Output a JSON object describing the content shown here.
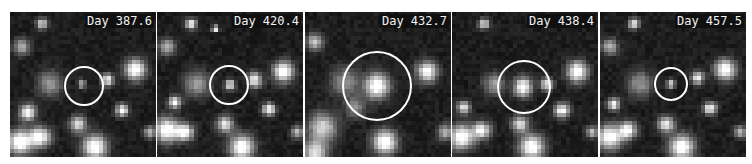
{
  "figure": {
    "panels": [
      {
        "label": "Day 387.6",
        "left": 10,
        "circle": {
          "cx": 74,
          "cy": 74,
          "r": 20
        },
        "sources": [
          {
            "x": 72,
            "y": 72,
            "s": 4,
            "b": 150
          },
          {
            "x": 125,
            "y": 58,
            "s": 10,
            "b": 255
          },
          {
            "x": 98,
            "y": 68,
            "s": 6,
            "b": 210
          },
          {
            "x": 112,
            "y": 98,
            "s": 6,
            "b": 230
          },
          {
            "x": 32,
            "y": 12,
            "s": 5,
            "b": 200
          },
          {
            "x": 12,
            "y": 35,
            "s": 8,
            "b": 150
          },
          {
            "x": 40,
            "y": 72,
            "s": 12,
            "b": 120
          },
          {
            "x": 18,
            "y": 100,
            "s": 8,
            "b": 230
          },
          {
            "x": 10,
            "y": 130,
            "s": 12,
            "b": 255
          },
          {
            "x": 30,
            "y": 125,
            "s": 10,
            "b": 240
          },
          {
            "x": 68,
            "y": 112,
            "s": 8,
            "b": 200
          },
          {
            "x": 85,
            "y": 135,
            "s": 12,
            "b": 255
          },
          {
            "x": 140,
            "y": 120,
            "s": 6,
            "b": 160
          }
        ]
      },
      {
        "label": "Day 420.4",
        "left": 157,
        "circle": {
          "cx": 72,
          "cy": 73,
          "r": 20
        },
        "sources": [
          {
            "x": 73,
            "y": 73,
            "s": 5,
            "b": 210
          },
          {
            "x": 126,
            "y": 60,
            "s": 10,
            "b": 255
          },
          {
            "x": 98,
            "y": 68,
            "s": 7,
            "b": 220
          },
          {
            "x": 112,
            "y": 97,
            "s": 6,
            "b": 230
          },
          {
            "x": 34,
            "y": 12,
            "s": 5,
            "b": 220
          },
          {
            "x": 58,
            "y": 17,
            "s": 3,
            "b": 255
          },
          {
            "x": 10,
            "y": 35,
            "s": 8,
            "b": 150
          },
          {
            "x": 40,
            "y": 72,
            "s": 12,
            "b": 130
          },
          {
            "x": 18,
            "y": 90,
            "s": 6,
            "b": 220
          },
          {
            "x": 10,
            "y": 118,
            "s": 12,
            "b": 255
          },
          {
            "x": 28,
            "y": 120,
            "s": 8,
            "b": 240
          },
          {
            "x": 68,
            "y": 112,
            "s": 8,
            "b": 210
          },
          {
            "x": 85,
            "y": 135,
            "s": 12,
            "b": 255
          },
          {
            "x": 140,
            "y": 120,
            "s": 6,
            "b": 160
          }
        ]
      },
      {
        "label": "Day 432.7",
        "left": 305,
        "circle": {
          "cx": 72,
          "cy": 74,
          "r": 35
        },
        "sources": [
          {
            "x": 72,
            "y": 74,
            "s": 12,
            "b": 255
          },
          {
            "x": 122,
            "y": 60,
            "s": 10,
            "b": 240
          },
          {
            "x": 10,
            "y": 30,
            "s": 8,
            "b": 170
          },
          {
            "x": 40,
            "y": 70,
            "s": 14,
            "b": 110
          },
          {
            "x": 18,
            "y": 115,
            "s": 14,
            "b": 190
          },
          {
            "x": 10,
            "y": 140,
            "s": 12,
            "b": 200
          },
          {
            "x": 80,
            "y": 130,
            "s": 12,
            "b": 255
          },
          {
            "x": 140,
            "y": 120,
            "s": 8,
            "b": 150
          },
          {
            "x": 50,
            "y": 95,
            "s": 10,
            "b": 110
          }
        ]
      },
      {
        "label": "Day 438.4",
        "left": 452,
        "circle": {
          "cx": 72,
          "cy": 75,
          "r": 27
        },
        "sources": [
          {
            "x": 71,
            "y": 75,
            "s": 9,
            "b": 245
          },
          {
            "x": 125,
            "y": 60,
            "s": 10,
            "b": 255
          },
          {
            "x": 95,
            "y": 72,
            "s": 6,
            "b": 200
          },
          {
            "x": 110,
            "y": 98,
            "s": 7,
            "b": 230
          },
          {
            "x": 32,
            "y": 12,
            "s": 5,
            "b": 200
          },
          {
            "x": 42,
            "y": 72,
            "s": 10,
            "b": 130
          },
          {
            "x": 12,
            "y": 95,
            "s": 6,
            "b": 220
          },
          {
            "x": 10,
            "y": 125,
            "s": 12,
            "b": 255
          },
          {
            "x": 30,
            "y": 118,
            "s": 8,
            "b": 230
          },
          {
            "x": 68,
            "y": 112,
            "s": 8,
            "b": 200
          },
          {
            "x": 80,
            "y": 135,
            "s": 12,
            "b": 255
          },
          {
            "x": 140,
            "y": 120,
            "s": 6,
            "b": 160
          }
        ]
      },
      {
        "label": "Day 457.5",
        "left": 600,
        "circle": {
          "cx": 71,
          "cy": 72,
          "r": 17
        },
        "sources": [
          {
            "x": 71,
            "y": 72,
            "s": 4,
            "b": 190
          },
          {
            "x": 125,
            "y": 58,
            "s": 10,
            "b": 255
          },
          {
            "x": 98,
            "y": 66,
            "s": 6,
            "b": 220
          },
          {
            "x": 110,
            "y": 96,
            "s": 6,
            "b": 230
          },
          {
            "x": 34,
            "y": 12,
            "s": 5,
            "b": 210
          },
          {
            "x": 10,
            "y": 35,
            "s": 8,
            "b": 150
          },
          {
            "x": 40,
            "y": 72,
            "s": 12,
            "b": 120
          },
          {
            "x": 14,
            "y": 92,
            "s": 6,
            "b": 220
          },
          {
            "x": 10,
            "y": 125,
            "s": 12,
            "b": 255
          },
          {
            "x": 28,
            "y": 118,
            "s": 8,
            "b": 240
          },
          {
            "x": 66,
            "y": 112,
            "s": 8,
            "b": 210
          },
          {
            "x": 82,
            "y": 135,
            "s": 12,
            "b": 255
          },
          {
            "x": 140,
            "y": 120,
            "s": 6,
            "b": 160
          }
        ]
      }
    ]
  }
}
